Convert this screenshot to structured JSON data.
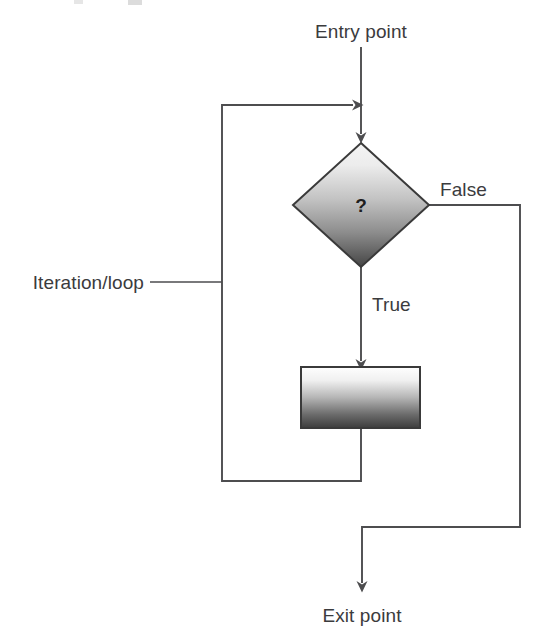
{
  "diagram": {
    "type": "flowchart",
    "title_fragment": "",
    "background_color": "#ffffff",
    "line_color": "#4d4d4f",
    "text_color": "#3b3b3d",
    "labels": {
      "entry": "Entry point",
      "exit": "Exit point",
      "iteration": "Iteration/loop",
      "branch_true": "True",
      "branch_false": "False"
    },
    "nodes": [
      {
        "id": "decision",
        "shape": "diamond",
        "text": "?",
        "center_x": 361,
        "center_y": 205,
        "half_width": 68,
        "half_height": 62,
        "fill_top": "#f2f2f2",
        "fill_bottom": "#4a4a4a",
        "stroke": "#3a3a3a"
      },
      {
        "id": "process",
        "shape": "rectangle",
        "text": "",
        "x": 301,
        "y": 367,
        "width": 119,
        "height": 61,
        "fill_top": "#fdfdfd",
        "fill_bottom": "#3f3f3f",
        "stroke": "#3a3a3a"
      }
    ],
    "edges": [
      {
        "id": "entry-edge",
        "from": "entry-point",
        "to": "decision",
        "label": ""
      },
      {
        "id": "true-edge",
        "from": "decision",
        "to": "process",
        "label": "True"
      },
      {
        "id": "false-edge",
        "from": "decision",
        "to": "exit-point",
        "label": "False"
      },
      {
        "id": "loop-edge",
        "from": "process",
        "to": "entry-edge",
        "label": "Iteration/loop"
      }
    ]
  }
}
